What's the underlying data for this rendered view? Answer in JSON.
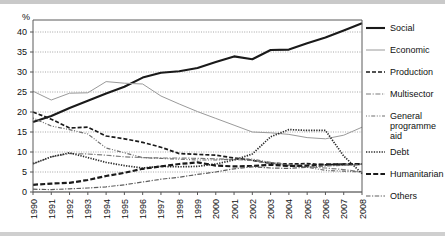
{
  "chart_data": {
    "type": "line",
    "title": "",
    "xlabel": "",
    "ylabel": "%",
    "ylim": [
      0,
      43
    ],
    "yticks": [
      0,
      5,
      10,
      15,
      20,
      25,
      30,
      35,
      40
    ],
    "grid": true,
    "legend_position": "right",
    "categories": [
      "1990",
      "1991",
      "1992",
      "1993",
      "1994",
      "1995",
      "1996",
      "1997",
      "1998",
      "1999",
      "2000",
      "2001",
      "2002",
      "2003",
      "2004",
      "2005",
      "2006",
      "2007",
      "2008"
    ],
    "series": [
      {
        "name": "Social",
        "style": "solid-thick",
        "color": "#1a1a1a",
        "values": [
          17.5,
          19.0,
          21.0,
          22.8,
          24.6,
          26.3,
          28.6,
          29.8,
          30.2,
          31.0,
          32.5,
          33.9,
          33.2,
          35.5,
          35.6,
          37.2,
          38.6,
          40.4,
          42.2
        ]
      },
      {
        "name": "Economic",
        "style": "solid-thin",
        "color": "#9a9a9a",
        "values": [
          25.2,
          23.0,
          24.7,
          24.8,
          27.6,
          27.2,
          27.0,
          24.0,
          22.0,
          20.1,
          18.4,
          16.7,
          15.0,
          14.8,
          14.4,
          13.6,
          13.3,
          14.2,
          16.2
        ]
      },
      {
        "name": "Production",
        "style": "dashed",
        "color": "#1a1a1a",
        "values": [
          20.0,
          18.2,
          16.0,
          16.2,
          14.0,
          13.3,
          12.4,
          11.2,
          9.6,
          9.4,
          9.2,
          8.5,
          7.9,
          7.2,
          7.0,
          7.1,
          6.8,
          7.0,
          7.0
        ]
      },
      {
        "name": "Multisector",
        "style": "dash-dot",
        "color": "#7d7d7d",
        "values": [
          7.0,
          8.8,
          9.6,
          9.5,
          9.2,
          8.8,
          8.6,
          8.5,
          8.5,
          8.4,
          8.3,
          8.1,
          7.9,
          7.1,
          6.6,
          6.3,
          6.0,
          5.6,
          5.0
        ]
      },
      {
        "name": "General programme aid",
        "style": "dot-dash",
        "color": "#6e6e6e",
        "values": [
          18.5,
          16.5,
          15.6,
          14.5,
          11.0,
          9.8,
          8.6,
          8.4,
          8.2,
          8.0,
          8.0,
          8.2,
          8.2,
          7.4,
          6.8,
          6.2,
          5.4,
          5.2,
          5.0
        ]
      },
      {
        "name": "Debt",
        "style": "dotted",
        "color": "#2b2b2b",
        "values": [
          7.1,
          8.8,
          9.8,
          8.6,
          7.4,
          6.6,
          6.0,
          6.4,
          6.3,
          6.4,
          7.0,
          8.0,
          9.5,
          13.8,
          15.6,
          15.4,
          15.4,
          9.0,
          4.6
        ]
      },
      {
        "name": "Humanitarian",
        "style": "dash-thick",
        "color": "#1a1a1a",
        "values": [
          1.8,
          2.1,
          2.3,
          3.0,
          4.0,
          4.8,
          5.8,
          6.4,
          7.0,
          7.4,
          6.6,
          6.4,
          6.5,
          6.8,
          6.5,
          6.6,
          6.9,
          6.9,
          7.0
        ]
      },
      {
        "name": "Others",
        "style": "dash-dot-thin",
        "color": "#5e5e5e",
        "values": [
          0.7,
          0.6,
          0.8,
          1.0,
          1.3,
          1.8,
          2.5,
          3.2,
          3.7,
          4.4,
          5.0,
          5.8,
          6.3,
          6.0,
          5.9,
          6.2,
          6.5,
          6.7,
          6.9
        ]
      }
    ]
  },
  "legend": {
    "items": [
      {
        "label": "Social"
      },
      {
        "label": "Economic"
      },
      {
        "label": "Production"
      },
      {
        "label": "Multisector"
      },
      {
        "label": "General"
      },
      {
        "label": "programme"
      },
      {
        "label": "aid"
      },
      {
        "label": "Debt"
      },
      {
        "label": "Humanitarian"
      },
      {
        "label": "Others"
      }
    ]
  }
}
